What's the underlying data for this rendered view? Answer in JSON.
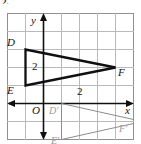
{
  "caption": "2.",
  "figure": {
    "name": "triangle-dilation-coordinate-plane",
    "grid": {
      "x_min": -2,
      "x_max": 5,
      "y_min": -3,
      "y_max": 4,
      "unit_px": 18,
      "show_grid": true,
      "grid_color": "#b9b9c4",
      "border_color": "#8f8f9b"
    },
    "axes": {
      "x_label": "x",
      "y_label": "y",
      "origin_label": "O",
      "axis_color": "#101010"
    },
    "measures": [
      {
        "text": "2",
        "note": "side DE length label"
      },
      {
        "text": "2",
        "note": "horizontal distance label on x-axis"
      }
    ],
    "shapes": [
      {
        "name": "triangle-DEF",
        "style": "bold-black",
        "color": "#101010",
        "stroke_width": 2.2,
        "vertices": [
          {
            "label": "D",
            "x": -1,
            "y": 3
          },
          {
            "label": "E",
            "x": -1,
            "y": 1
          },
          {
            "label": "F",
            "x": 4,
            "y": 2
          }
        ]
      },
      {
        "name": "triangle-D-prime-E-prime-F-prime",
        "style": "light-gray",
        "color": "#8d8d8d",
        "stroke_width": 1,
        "vertices": [
          {
            "label": "D'",
            "x": 1,
            "y": 0
          },
          {
            "label": "E'",
            "x": 1,
            "y": -2
          },
          {
            "label": "F'",
            "x": 5.5,
            "y": -1
          }
        ]
      }
    ],
    "labels": {
      "D": "D",
      "E": "E",
      "F": "F",
      "D_prime": "D'",
      "E_prime": "E'",
      "F_prime": "F'",
      "origin": "O",
      "x_axis": "x",
      "y_axis": "y",
      "measure_de": "2",
      "measure_x": "2"
    }
  }
}
